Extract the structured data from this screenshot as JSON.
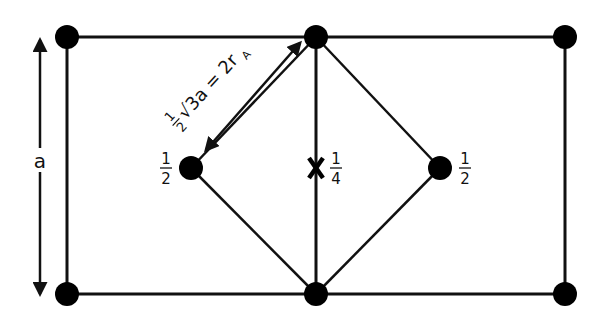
{
  "diagram": {
    "type": "unit cell projection",
    "colors": {
      "line": "#111111",
      "atom": "#000000",
      "background": "#ffffff"
    },
    "edge_label": "a",
    "diagonal_label": {
      "frac_num": "1",
      "frac_den": "2",
      "root": "√3a = 2r",
      "subscript": "A"
    },
    "atoms": [
      {
        "id": "corner-tl",
        "x": 67,
        "y": 37
      },
      {
        "id": "edge-top-mid",
        "x": 316,
        "y": 37
      },
      {
        "id": "corner-tr",
        "x": 565,
        "y": 37
      },
      {
        "id": "corner-bl",
        "x": 67,
        "y": 294
      },
      {
        "id": "edge-bottom-mid",
        "x": 316,
        "y": 294
      },
      {
        "id": "corner-br",
        "x": 565,
        "y": 294
      },
      {
        "id": "body-left",
        "x": 191,
        "y": 168,
        "height_label": {
          "num": "1",
          "den": "2"
        }
      },
      {
        "id": "body-right",
        "x": 440,
        "y": 168,
        "height_label": {
          "num": "1",
          "den": "2"
        }
      }
    ],
    "interstitial": {
      "symbol": "X",
      "x": 316,
      "y": 168,
      "height_label": {
        "num": "1",
        "den": "4"
      }
    }
  }
}
